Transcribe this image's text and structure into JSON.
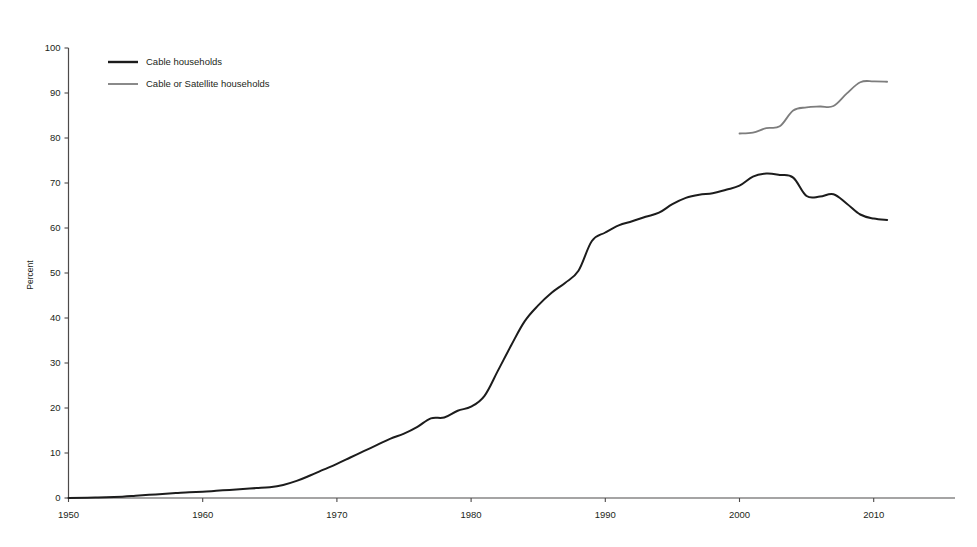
{
  "chart_data": {
    "type": "line",
    "title": "",
    "subtitle": "",
    "xlabel": "",
    "ylabel": "Percent",
    "xlim": [
      1950,
      2015
    ],
    "ylim": [
      0,
      100
    ],
    "grid": false,
    "legend_position": "top-left",
    "x_ticks": [
      1950,
      1960,
      1970,
      1980,
      1990,
      2000,
      2010
    ],
    "x_tick_labels": [
      "1950",
      "1960",
      "1970",
      "1980",
      "1990",
      "2000",
      "2010"
    ],
    "y_ticks": [
      0,
      10,
      20,
      30,
      40,
      50,
      60,
      70,
      80,
      90,
      100
    ],
    "y_tick_labels": [
      "0",
      "10",
      "20",
      "30",
      "40",
      "50",
      "60",
      "70",
      "80",
      "90",
      "100"
    ],
    "series": [
      {
        "name": "Cable households",
        "color": "#1c1c1c",
        "width": 2.0,
        "x": [
          1950,
          1952,
          1954,
          1955,
          1956,
          1957,
          1958,
          1959,
          1960,
          1961,
          1962,
          1963,
          1964,
          1965,
          1966,
          1967,
          1968,
          1969,
          1970,
          1971,
          1972,
          1973,
          1974,
          1975,
          1976,
          1977,
          1978,
          1979,
          1980,
          1981,
          1982,
          1983,
          1984,
          1985,
          1986,
          1987,
          1988,
          1989,
          1990,
          1991,
          1992,
          1993,
          1994,
          1995,
          1996,
          1997,
          1998,
          1999,
          2000,
          2001,
          2002,
          2003,
          2004,
          2005,
          2006,
          2007,
          2008,
          2009,
          2010,
          2011
        ],
        "values": [
          0.0,
          0.1,
          0.3,
          0.5,
          0.7,
          0.9,
          1.1,
          1.3,
          1.4,
          1.6,
          1.8,
          2.0,
          2.2,
          2.4,
          2.9,
          3.8,
          5.0,
          6.3,
          7.6,
          9.0,
          10.4,
          11.8,
          13.2,
          14.3,
          15.8,
          17.7,
          17.9,
          19.4,
          20.3,
          22.7,
          28.3,
          34.0,
          39.3,
          42.8,
          45.6,
          47.8,
          50.5,
          57.1,
          59.0,
          60.6,
          61.5,
          62.5,
          63.4,
          65.3,
          66.7,
          67.4,
          67.7,
          68.5,
          69.4,
          71.4,
          72.1,
          71.8,
          71.2,
          67.1,
          67.0,
          67.5,
          65.4,
          63.0,
          62.1,
          61.8
        ]
      },
      {
        "name": "Cable or Satellite households",
        "color": "#7d7d7d",
        "width": 1.8,
        "x": [
          2000,
          2001,
          2002,
          2003,
          2004,
          2005,
          2006,
          2007,
          2008,
          2009,
          2010,
          2011
        ],
        "values": [
          81.0,
          81.2,
          82.2,
          82.6,
          86.1,
          86.8,
          87.0,
          87.1,
          89.9,
          92.4,
          92.6,
          92.5
        ]
      }
    ]
  },
  "legend": {
    "items": [
      {
        "label": "Cable households",
        "color": "#1c1c1c"
      },
      {
        "label": "Cable or Satellite households",
        "color": "#7d7d7d"
      }
    ]
  },
  "axis": {
    "y_title": "Percent"
  }
}
